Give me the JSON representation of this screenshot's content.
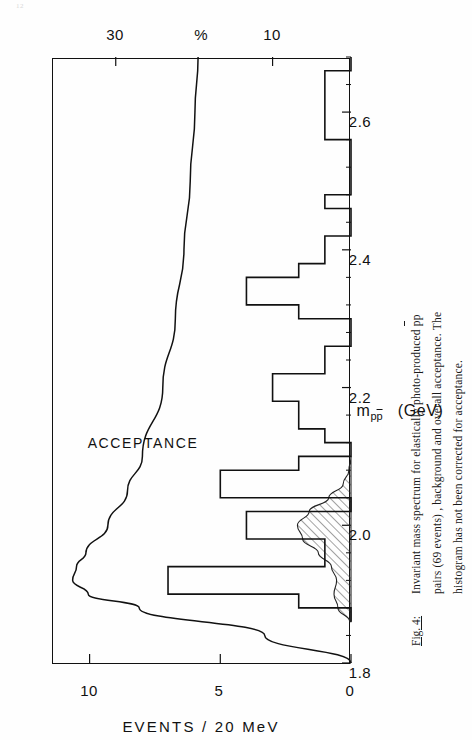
{
  "page": {
    "number": "12"
  },
  "figure": {
    "caption_label": "Fig. 4:",
    "caption_line1_a": "Invariant mass spectrum for elastically photo-produced ",
    "caption_line1_pbar": "p",
    "caption_line1_b": "p",
    "caption_line2": "pairs (69 events) , background and overall acceptance.  The",
    "caption_line3": "histogram has not been corrected for acceptance."
  },
  "chart_data": {
    "type": "bar",
    "title": "",
    "xlabel": "m_ppbar  (GeV)",
    "xlabel_main": "m",
    "xlabel_sub_left": "p",
    "xlabel_sub_right": "p",
    "xlabel_units": "(GeV)",
    "ylabel": "EVENTS / 20 MeV",
    "y2label": "%",
    "xlim": [
      1.8,
      2.68
    ],
    "ylim": [
      0,
      11.4
    ],
    "y2lim": [
      0,
      38
    ],
    "grid": false,
    "legend": "none",
    "annotations": [
      {
        "text": "ACCEPTANCE",
        "x": 2.12,
        "y2": 26.5
      }
    ],
    "xticks": [
      1.8,
      2.0,
      2.2,
      2.4,
      2.6
    ],
    "xtick_labels": [
      "1.8",
      "2.0",
      "2.2",
      "2.4",
      "2.6"
    ],
    "xticks_minor": [
      1.84,
      1.88,
      1.92,
      1.96,
      2.04,
      2.08,
      2.12,
      2.16,
      2.24,
      2.28,
      2.32,
      2.36,
      2.44,
      2.48,
      2.52,
      2.56,
      2.64,
      2.68
    ],
    "yticks": [
      0,
      5,
      10
    ],
    "ytick_labels": [
      "0",
      "5",
      "10"
    ],
    "y2ticks": [
      10,
      30
    ],
    "y2tick_labels": [
      "10",
      "30"
    ],
    "bin_width": 0.02,
    "bin_edges": [
      1.86,
      1.88,
      1.9,
      1.92,
      1.94,
      1.96,
      1.98,
      2.0,
      2.02,
      2.04,
      2.06,
      2.08,
      2.1,
      2.12,
      2.14,
      2.16,
      2.18,
      2.2,
      2.22,
      2.24,
      2.26,
      2.28,
      2.3,
      2.32,
      2.34,
      2.36,
      2.38,
      2.4,
      2.42,
      2.44,
      2.46,
      2.48,
      2.5,
      2.52,
      2.54,
      2.56,
      2.58,
      2.6,
      2.62,
      2.64,
      2.66,
      2.68
    ],
    "categories": [
      "1.86-1.88",
      "1.88-1.90",
      "1.90-1.92",
      "1.92-1.94",
      "1.94-1.96",
      "1.96-1.98",
      "1.98-2.00",
      "2.00-2.02",
      "2.02-2.04",
      "2.04-2.06",
      "2.06-2.08",
      "2.08-2.10",
      "2.10-2.12",
      "2.12-2.14",
      "2.14-2.16",
      "2.16-2.18",
      "2.18-2.20",
      "2.20-2.22",
      "2.22-2.24",
      "2.24-2.26",
      "2.26-2.28",
      "2.28-2.30",
      "2.30-2.32",
      "2.32-2.34",
      "2.34-2.36",
      "2.36-2.38",
      "2.38-2.40",
      "2.40-2.42",
      "2.42-2.44",
      "2.44-2.46",
      "2.46-2.48",
      "2.48-2.50",
      "2.50-2.52",
      "2.52-2.54",
      "2.54-2.56",
      "2.56-2.58",
      "2.58-2.60",
      "2.60-2.62",
      "2.62-2.64",
      "2.64-2.66",
      "2.66-2.68"
    ],
    "values": [
      0,
      2,
      7,
      7,
      1,
      1,
      4,
      4,
      0,
      5,
      5,
      2,
      0,
      1,
      2,
      2,
      3,
      3,
      1,
      1,
      0,
      0,
      2,
      4,
      4,
      2,
      1,
      1,
      0,
      0,
      1,
      0,
      0,
      0,
      0,
      1,
      1,
      1,
      1,
      1,
      0
    ],
    "series": [
      {
        "name": "EVENTS / 20 MeV",
        "kind": "histogram",
        "axis": "left",
        "values": [
          0,
          2,
          7,
          7,
          1,
          1,
          4,
          4,
          0,
          5,
          5,
          2,
          0,
          1,
          2,
          2,
          3,
          3,
          1,
          1,
          0,
          0,
          2,
          4,
          4,
          2,
          1,
          1,
          0,
          0,
          1,
          0,
          0,
          0,
          0,
          1,
          1,
          1,
          1,
          1,
          0
        ]
      },
      {
        "name": "background",
        "kind": "hatched-area",
        "axis": "left",
        "x": [
          1.86,
          1.88,
          1.9,
          1.92,
          1.94,
          1.96,
          1.98,
          2.0,
          2.02,
          2.04,
          2.06,
          2.08,
          2.1
        ],
        "values": [
          0.05,
          0.5,
          0.65,
          0.55,
          0.75,
          1.25,
          1.85,
          2.05,
          1.6,
          0.85,
          0.3,
          0.08,
          0.0
        ]
      },
      {
        "name": "ACCEPTANCE",
        "kind": "line",
        "axis": "right",
        "x": [
          1.8,
          1.84,
          1.88,
          1.9,
          1.92,
          1.94,
          1.96,
          2.0,
          2.05,
          2.1,
          2.2,
          2.3,
          2.4,
          2.5,
          2.6,
          2.68
        ],
        "values": [
          0.0,
          11.0,
          27.0,
          33.5,
          35.5,
          35.0,
          33.8,
          31.0,
          28.5,
          26.6,
          24.0,
          22.4,
          21.3,
          20.5,
          19.9,
          19.5
        ]
      }
    ]
  }
}
